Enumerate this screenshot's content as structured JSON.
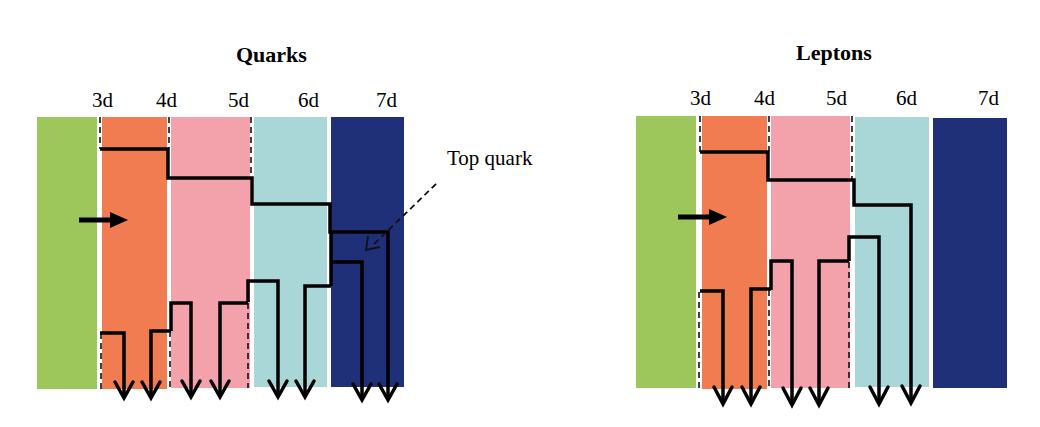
{
  "panels": [
    {
      "id": "quarks",
      "title": "Quarks",
      "dimension_labels": [
        "3d",
        "4d",
        "5d",
        "6d",
        "7d"
      ],
      "bands": [
        {
          "name": "green",
          "color": "#9dc75a"
        },
        {
          "name": "orange",
          "color": "#f27c52"
        },
        {
          "name": "pink",
          "color": "#f3a1aa"
        },
        {
          "name": "lightblue",
          "color": "#a9d6d7"
        },
        {
          "name": "navy",
          "color": "#1f2f78"
        }
      ],
      "annotation": "Top quark",
      "down_arrow_count": 8
    },
    {
      "id": "leptons",
      "title": "Leptons",
      "dimension_labels": [
        "3d",
        "4d",
        "5d",
        "6d",
        "7d"
      ],
      "bands": [
        {
          "name": "green",
          "color": "#9dc75a"
        },
        {
          "name": "orange",
          "color": "#f27c52"
        },
        {
          "name": "pink",
          "color": "#f3a1aa"
        },
        {
          "name": "lightblue",
          "color": "#a9d6d7"
        },
        {
          "name": "navy",
          "color": "#1f2f78"
        }
      ],
      "down_arrow_count": 6
    }
  ]
}
